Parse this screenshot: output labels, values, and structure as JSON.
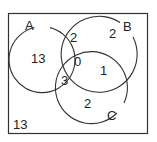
{
  "diagram": {
    "type": "venn-3",
    "colors": {
      "stroke": "#333333",
      "text": "#222222",
      "background": "#ffffff"
    },
    "sets": [
      {
        "id": "A",
        "label": "A"
      },
      {
        "id": "B",
        "label": "B"
      },
      {
        "id": "C",
        "label": "C"
      }
    ],
    "regions": {
      "A_only": "13",
      "B_only": "2",
      "C_only": "2",
      "A_and_B_only": "2",
      "B_and_C_only": "1",
      "A_and_C_only": "3",
      "A_and_B_and_C": "0",
      "outside": "13"
    }
  }
}
